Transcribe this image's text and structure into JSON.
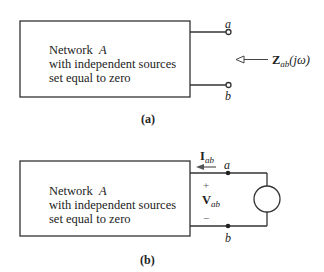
{
  "figure_a": {
    "network_label": "Network",
    "network_name": "A",
    "line2": "with independent sources",
    "line3": "set equal to zero",
    "terminal_top": "a",
    "terminal_bottom": "b",
    "impedance_symbol": "Z",
    "impedance_subscript": "ab",
    "impedance_arg": "(jω)",
    "caption": "(a)"
  },
  "figure_b": {
    "network_label": "Network",
    "network_name": "A",
    "line2": "with independent sources",
    "line3": "set equal to zero",
    "terminal_top": "a",
    "terminal_bottom": "b",
    "current_symbol": "I",
    "current_subscript": "ab",
    "voltage_symbol": "V",
    "voltage_subscript": "ab",
    "plus": "+",
    "minus": "−",
    "caption": "(b)"
  },
  "colors": {
    "line": "#333333",
    "text": "#222222",
    "arrow": "#555555"
  }
}
